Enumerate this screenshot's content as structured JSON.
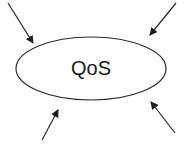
{
  "diagram": {
    "center_node": {
      "label": "QoS",
      "shape": "ellipse",
      "cx": 91,
      "cy": 68.5,
      "rx": 75,
      "ry": 31.5
    },
    "arrows": [
      {
        "name": "top-left",
        "from": [
          8,
          3
        ],
        "to": [
          33,
          43
        ]
      },
      {
        "name": "top-right",
        "from": [
          176,
          3
        ],
        "to": [
          150,
          35
        ]
      },
      {
        "name": "bottom-left",
        "from": [
          42,
          140
        ],
        "to": [
          58,
          110
        ]
      },
      {
        "name": "bottom-right",
        "from": [
          175,
          133
        ],
        "to": [
          151,
          102
        ]
      }
    ],
    "colors": {
      "stroke": "#2a2a2a",
      "background": "#ffffff"
    }
  }
}
